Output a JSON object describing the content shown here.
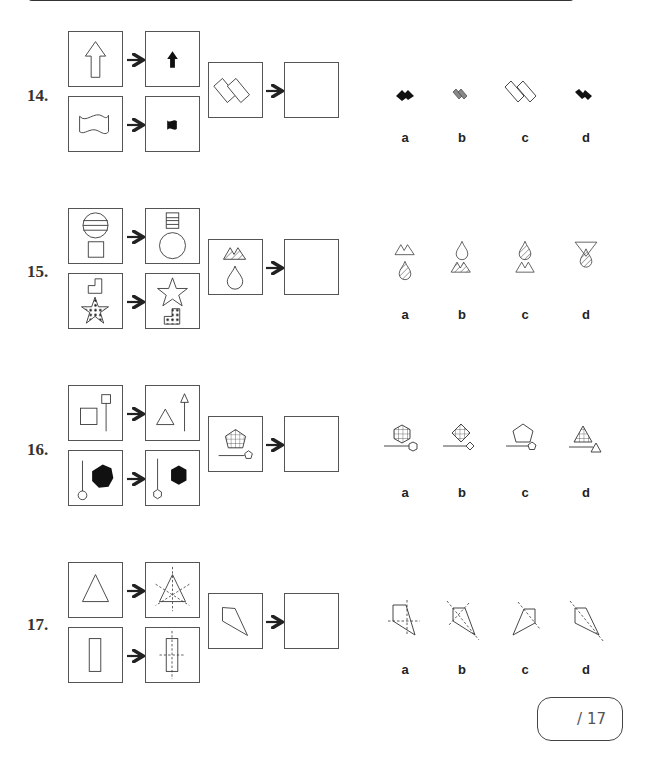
{
  "page": {
    "score": {
      "total_label": "/ 17"
    }
  },
  "questions": [
    {
      "number": "14.",
      "examples": [
        {
          "from": "outline-up-arrow-large",
          "to": "filled-black-up-arrow-small"
        },
        {
          "from": "outline-wavy-flag-large",
          "to": "filled-black-wavy-flag-small"
        }
      ],
      "question": "outline-two-overlapping-tilted-rectangles",
      "answer_box": "empty",
      "options": [
        {
          "letter": "a",
          "figure": "small-black-overlapping-rectangles-rotated"
        },
        {
          "letter": "b",
          "figure": "small-grey-overlapping-rectangles"
        },
        {
          "letter": "c",
          "figure": "large-outline-overlapping-rectangles"
        },
        {
          "letter": "d",
          "figure": "small-black-overlapping-rectangles"
        }
      ]
    },
    {
      "number": "15.",
      "examples": [
        {
          "from": "striped-circle-above-plain-square",
          "to": "striped-square-above-plain-circle"
        },
        {
          "from": "plain-L-shape-above-dotted-star",
          "to": "plain-star-above-dotted-L-shape"
        }
      ],
      "question": "striped-mountains-above-plain-drop",
      "answer_box": "empty",
      "options": [
        {
          "letter": "a",
          "figure": "plain-mountains-above-striped-drop"
        },
        {
          "letter": "b",
          "figure": "plain-drop-above-striped-mountains"
        },
        {
          "letter": "c",
          "figure": "striped-drop-above-plain-mountains"
        },
        {
          "letter": "d",
          "figure": "inverted-triangle-with-striped-drop"
        }
      ]
    },
    {
      "number": "16.",
      "examples": [
        {
          "from": "square-and-line-with-small-square",
          "to": "triangle-and-line-with-small-triangle"
        },
        {
          "from": "black-heptagon-and-line-with-circle",
          "to": "black-hexagon-and-line-with-hexagon"
        }
      ],
      "question": "gridded-pentagon-and-line-with-small-pentagon",
      "answer_box": "empty",
      "options": [
        {
          "letter": "a",
          "figure": "gridded-hexagon-line-small-hexagon"
        },
        {
          "letter": "b",
          "figure": "gridded-diamond-line-small-diamond"
        },
        {
          "letter": "c",
          "figure": "plain-pentagon-line-small-pentagon"
        },
        {
          "letter": "d",
          "figure": "gridded-triangle-line-small-triangle"
        }
      ]
    },
    {
      "number": "17.",
      "examples": [
        {
          "from": "plain-triangle",
          "to": "triangle-with-symmetry-lines"
        },
        {
          "from": "plain-rectangle",
          "to": "rectangle-with-symmetry-lines"
        }
      ],
      "question": "kite-shape",
      "answer_box": "empty",
      "options": [
        {
          "letter": "a",
          "figure": "kite-with-cross-lines"
        },
        {
          "letter": "b",
          "figure": "kite-with-diagonal-and-perpendicular-lines"
        },
        {
          "letter": "c",
          "figure": "rotated-kite-with-diagonal"
        },
        {
          "letter": "d",
          "figure": "kite-with-diagonal-symmetry-line"
        }
      ]
    }
  ]
}
